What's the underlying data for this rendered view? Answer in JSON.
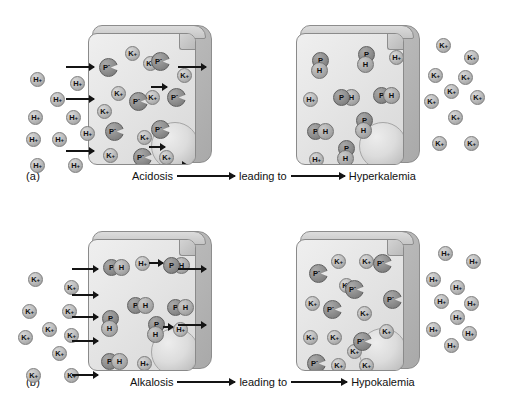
{
  "figure": {
    "labels": {
      "ion_k": "K",
      "ion_h": "H",
      "ion_p": "P",
      "charge_plus": "+",
      "charge_minus": "-"
    }
  },
  "rows": [
    {
      "id": "a",
      "row_label": "(a)",
      "caption": {
        "cause": "Acidosis",
        "connector": "leading to",
        "effect": "Hyperkalemia"
      },
      "left_panel": {
        "name": "acidosis-initial-cell",
        "outside_ions": [
          {
            "t": "H",
            "x": 22,
            "y": 44
          },
          {
            "t": "H",
            "x": 62,
            "y": 48
          },
          {
            "t": "H",
            "x": 42,
            "y": 64
          },
          {
            "t": "H",
            "x": 20,
            "y": 82
          },
          {
            "t": "H",
            "x": 58,
            "y": 82
          },
          {
            "t": "H",
            "x": 18,
            "y": 104
          },
          {
            "t": "H",
            "x": 44,
            "y": 104
          },
          {
            "t": "H",
            "x": 72,
            "y": 98
          },
          {
            "t": "H",
            "x": 22,
            "y": 130
          },
          {
            "t": "H",
            "x": 60,
            "y": 130
          }
        ],
        "inside_ions": [
          {
            "t": "K",
            "x": 36,
            "y": 12
          },
          {
            "t": "K",
            "x": 54,
            "y": 22
          },
          {
            "t": "K",
            "x": 22,
            "y": 52
          },
          {
            "t": "K",
            "x": 8,
            "y": 70
          },
          {
            "t": "K",
            "x": 56,
            "y": 56
          },
          {
            "t": "K",
            "x": 88,
            "y": 34
          },
          {
            "t": "K",
            "x": 48,
            "y": 96
          },
          {
            "t": "K",
            "x": 14,
            "y": 114
          },
          {
            "t": "K",
            "x": 70,
            "y": 116
          }
        ],
        "inside_proteins": [
          {
            "x": 10,
            "y": 24
          },
          {
            "x": 62,
            "y": 18
          },
          {
            "x": 40,
            "y": 58
          },
          {
            "x": 78,
            "y": 54
          },
          {
            "x": 16,
            "y": 88
          },
          {
            "x": 62,
            "y": 86
          },
          {
            "x": 44,
            "y": 114
          }
        ],
        "influx_arrows": 3,
        "efflux_arrows": 1,
        "internal_arrows": 3
      },
      "right_panel": {
        "name": "hyperkalemia-result-cell",
        "inside_complexes": [
          {
            "o": "vert",
            "x": 14,
            "y": 18
          },
          {
            "o": "vert",
            "x": 60,
            "y": 12
          },
          {
            "o": "horiz",
            "x": 36,
            "y": 54
          },
          {
            "o": "horiz",
            "x": 76,
            "y": 52
          },
          {
            "o": "horiz",
            "x": 10,
            "y": 88
          },
          {
            "o": "vert",
            "x": 58,
            "y": 78
          },
          {
            "o": "vert",
            "x": 40,
            "y": 106
          }
        ],
        "inside_ions": [
          {
            "t": "H",
            "x": 92,
            "y": 16
          },
          {
            "t": "H",
            "x": 6,
            "y": 58
          },
          {
            "t": "H",
            "x": 12,
            "y": 118
          }
        ],
        "outside_ions": [
          {
            "t": "K",
            "x": 12,
            "y": 10
          },
          {
            "t": "K",
            "x": 40,
            "y": 22
          },
          {
            "t": "K",
            "x": 4,
            "y": 40
          },
          {
            "t": "K",
            "x": 34,
            "y": 42
          },
          {
            "t": "K",
            "x": 20,
            "y": 56
          },
          {
            "t": "K",
            "x": 46,
            "y": 62
          },
          {
            "t": "K",
            "x": 0,
            "y": 66
          },
          {
            "t": "K",
            "x": 24,
            "y": 82
          },
          {
            "t": "K",
            "x": 8,
            "y": 108
          },
          {
            "t": "K",
            "x": 40,
            "y": 108
          }
        ]
      }
    },
    {
      "id": "b",
      "row_label": "(b)",
      "caption": {
        "cause": "Alkalosis",
        "connector": "leading to",
        "effect": "Hypokalemia"
      },
      "left_panel": {
        "name": "alkalosis-initial-cell",
        "outside_ions": [
          {
            "t": "K",
            "x": 20,
            "y": 38
          },
          {
            "t": "K",
            "x": 56,
            "y": 46
          },
          {
            "t": "K",
            "x": 14,
            "y": 70
          },
          {
            "t": "K",
            "x": 54,
            "y": 70
          },
          {
            "t": "K",
            "x": 34,
            "y": 88
          },
          {
            "t": "K",
            "x": 10,
            "y": 96
          },
          {
            "t": "K",
            "x": 56,
            "y": 94
          },
          {
            "t": "K",
            "x": 44,
            "y": 112
          },
          {
            "t": "K",
            "x": 18,
            "y": 134
          },
          {
            "t": "K",
            "x": 56,
            "y": 134
          }
        ],
        "inside_complexes": [
          {
            "o": "horiz",
            "x": 14,
            "y": 18
          },
          {
            "o": "horiz",
            "x": 74,
            "y": 16
          },
          {
            "o": "horiz",
            "x": 38,
            "y": 56
          },
          {
            "o": "horiz",
            "x": 78,
            "y": 58
          },
          {
            "o": "vert",
            "x": 12,
            "y": 70
          },
          {
            "o": "vert",
            "x": 58,
            "y": 76
          },
          {
            "o": "horiz",
            "x": 12,
            "y": 112
          }
        ],
        "inside_ions": [
          {
            "t": "H",
            "x": 46,
            "y": 16
          },
          {
            "t": "H",
            "x": 84,
            "y": 82
          },
          {
            "t": "H",
            "x": 48,
            "y": 116
          }
        ],
        "influx_arrows": 5,
        "efflux_arrows": 2,
        "internal_arrows": 2
      },
      "right_panel": {
        "name": "hypokalemia-result-cell",
        "inside_ions": [
          {
            "t": "K",
            "x": 34,
            "y": 14
          },
          {
            "t": "K",
            "x": 62,
            "y": 14
          },
          {
            "t": "K",
            "x": 42,
            "y": 38
          },
          {
            "t": "K",
            "x": 8,
            "y": 56
          },
          {
            "t": "K",
            "x": 60,
            "y": 66
          },
          {
            "t": "K",
            "x": 82,
            "y": 84
          },
          {
            "t": "K",
            "x": 6,
            "y": 90
          },
          {
            "t": "K",
            "x": 30,
            "y": 90
          },
          {
            "t": "K",
            "x": 50,
            "y": 104
          },
          {
            "t": "K",
            "x": 34,
            "y": 118
          },
          {
            "t": "K",
            "x": 62,
            "y": 118
          }
        ],
        "inside_proteins": [
          {
            "x": 12,
            "y": 24
          },
          {
            "x": 76,
            "y": 14
          },
          {
            "x": 48,
            "y": 40
          },
          {
            "x": 86,
            "y": 50
          },
          {
            "x": 26,
            "y": 60
          },
          {
            "x": 56,
            "y": 92
          },
          {
            "x": 10,
            "y": 114
          }
        ],
        "outside_ions": [
          {
            "t": "H",
            "x": 14,
            "y": 12
          },
          {
            "t": "H",
            "x": 42,
            "y": 20
          },
          {
            "t": "H",
            "x": 2,
            "y": 38
          },
          {
            "t": "H",
            "x": 26,
            "y": 46
          },
          {
            "t": "H",
            "x": 10,
            "y": 60
          },
          {
            "t": "H",
            "x": 40,
            "y": 62
          },
          {
            "t": "H",
            "x": 26,
            "y": 76
          },
          {
            "t": "H",
            "x": 2,
            "y": 88
          },
          {
            "t": "H",
            "x": 38,
            "y": 92
          },
          {
            "t": "H",
            "x": 20,
            "y": 104
          }
        ]
      }
    }
  ]
}
